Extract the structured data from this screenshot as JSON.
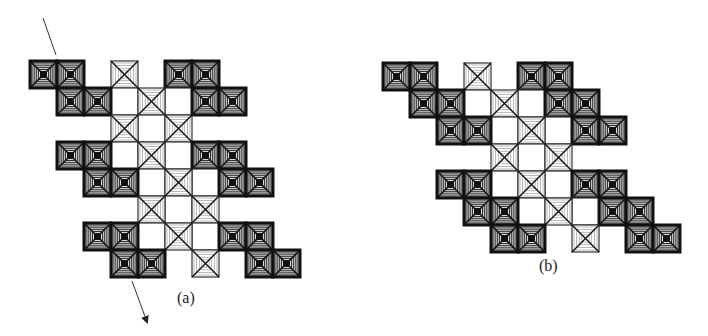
{
  "colors": {
    "dark_stroke": "#111111",
    "light_stroke": "#333333",
    "light_fill": "#d8d8d8",
    "background": "#ffffff"
  },
  "cell_size": 27,
  "figures": [
    {
      "id": "a",
      "label": "(a)",
      "origin": [
        30,
        61
      ],
      "label_pos": [
        177,
        289
      ],
      "rows": [
        {
          "dark": [
            0,
            1,
            5,
            6
          ],
          "cross": [
            3
          ],
          "plain": []
        },
        {
          "dark": [
            1,
            2,
            6,
            7
          ],
          "cross": [
            4
          ],
          "plain": [
            3,
            5
          ]
        },
        {
          "dark": [],
          "cross": [
            3,
            5
          ],
          "plain": [
            4
          ]
        },
        {
          "dark": [
            1,
            2,
            6,
            7
          ],
          "cross": [
            4
          ],
          "plain": [
            3,
            5
          ]
        },
        {
          "dark": [
            2,
            3,
            7,
            8
          ],
          "cross": [
            5
          ],
          "plain": [
            4,
            6
          ]
        },
        {
          "dark": [],
          "cross": [
            4,
            6
          ],
          "plain": [
            5
          ]
        },
        {
          "dark": [
            2,
            3,
            7,
            8
          ],
          "cross": [
            5
          ],
          "plain": [
            4,
            6
          ]
        },
        {
          "dark": [
            3,
            4,
            8,
            9
          ],
          "cross": [
            6
          ],
          "plain": []
        }
      ],
      "arrows": [
        {
          "from": [
            43,
            18
          ],
          "to": [
            56,
            55
          ],
          "head": false
        },
        {
          "from": [
            132,
            281
          ],
          "to": [
            147,
            322
          ],
          "head": true
        }
      ]
    },
    {
      "id": "b",
      "label": "(b)",
      "origin": [
        383,
        63
      ],
      "label_pos": [
        539,
        257
      ],
      "rows": [
        {
          "dark": [
            0,
            1,
            5,
            6
          ],
          "cross": [
            3
          ],
          "plain": []
        },
        {
          "dark": [
            1,
            2,
            6,
            7
          ],
          "cross": [
            4
          ],
          "plain": [
            3,
            5
          ]
        },
        {
          "dark": [
            2,
            3,
            7,
            8
          ],
          "cross": [
            5
          ],
          "plain": [
            4,
            6
          ]
        },
        {
          "dark": [],
          "cross": [
            4,
            6
          ],
          "plain": [
            5
          ]
        },
        {
          "dark": [
            2,
            3,
            7,
            8
          ],
          "cross": [
            5
          ],
          "plain": [
            4,
            6
          ]
        },
        {
          "dark": [
            3,
            4,
            8,
            9
          ],
          "cross": [
            6
          ],
          "plain": [
            5,
            7
          ]
        },
        {
          "dark": [
            4,
            5,
            9,
            10
          ],
          "cross": [
            7
          ],
          "plain": []
        }
      ],
      "arrows": []
    }
  ]
}
